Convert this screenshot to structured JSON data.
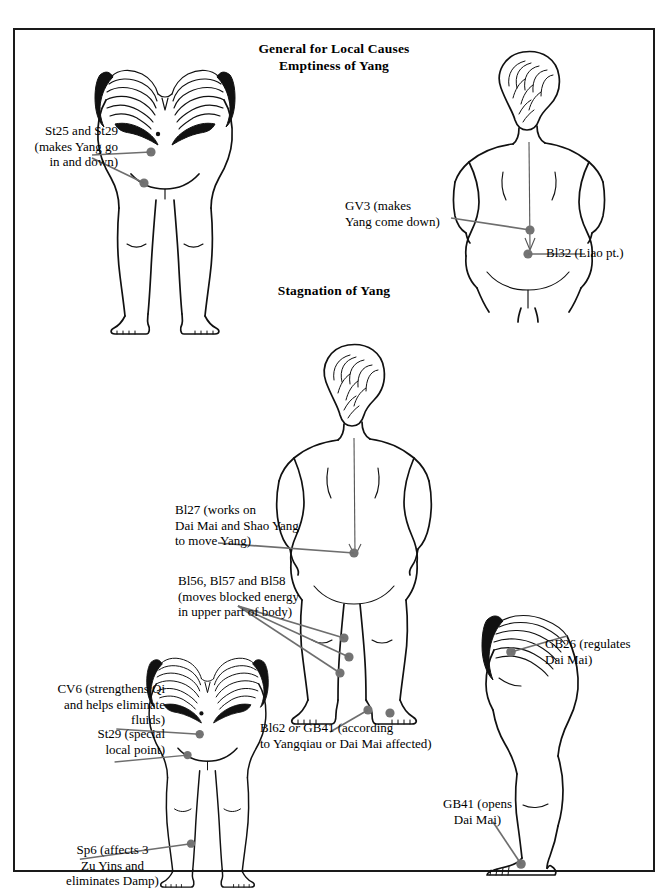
{
  "page": {
    "width": 668,
    "height": 892,
    "border_color": "#1a1a1a",
    "background": "#ffffff",
    "dot_color": "#737373",
    "leader_color": "#6e6e6e",
    "outline_color": "#111111"
  },
  "headings": {
    "main_line1": "General for Local Causes",
    "main_line2": "Emptiness of Yang",
    "section2": "Stagnation of Yang"
  },
  "annotations": {
    "st25_st29": "St25 and St29\n(makes Yang go\nin and down)",
    "gv3": "GV3 (makes\nYang come down)",
    "bl32": "Bl32 (Liao pt.)",
    "bl27": "Bl27 (works on\nDai Mai and Shao Yang\nto move Yang)",
    "bl56_57_58": "Bl56, Bl57 and Bl58\n(moves blocked energy\nin upper part of body)",
    "cv6": "CV6 (strengthens Qi\nand helps eliminate\nfluids)",
    "st29": "St29 (special\nlocal point)",
    "sp6": "Sp6 (affects 3\nZu Yins and\neliminates Damp)",
    "bl62_gb41_a": "Bl62 ",
    "bl62_gb41_or": "or",
    "bl62_gb41_b": " GB41 (according\nto Yangqiau or Dai Mai affected)",
    "gb26": "GB26 (regulates\nDai Mai)",
    "gb41": "GB41 (opens\nDai Mai)"
  },
  "figures": {
    "fig1_name": "female-front-torso-legs-emptiness",
    "fig2_name": "female-back-torso-emptiness",
    "fig3_name": "female-back-full-standing-stagnation",
    "fig4_name": "female-front-torso-legs-stagnation",
    "fig5_name": "female-side-profile-stagnation"
  },
  "points": {
    "st25": "St25",
    "st29a": "St29",
    "gv3": "GV3",
    "bl32": "Bl32",
    "bl27": "Bl27",
    "bl56": "Bl56",
    "bl57": "Bl57",
    "bl58": "Bl58",
    "bl62": "Bl62",
    "gb41_foot": "GB41",
    "cv6": "CV6",
    "st29b": "St29",
    "sp6": "Sp6",
    "gb26": "GB26",
    "gb41_side": "GB41"
  }
}
